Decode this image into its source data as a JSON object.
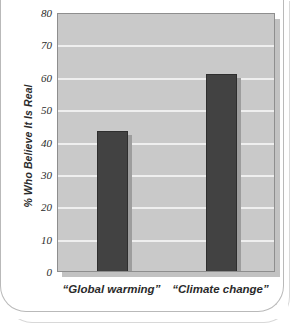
{
  "chart_data": {
    "type": "bar",
    "title": "",
    "subtitle": "",
    "xlabel": "",
    "ylabel": "% Who Believe It Is Real",
    "categories": [
      "“Global warming”",
      "“Climate change”"
    ],
    "values": [
      44,
      61.5
    ],
    "ylim": [
      0,
      80
    ],
    "yticks": [
      0,
      10,
      20,
      30,
      40,
      50,
      60,
      70,
      80
    ],
    "ytick_labels": [
      "0",
      "10",
      "20",
      "30",
      "40",
      "50",
      "60",
      "70",
      "80"
    ],
    "grid": true,
    "legend": false,
    "legend_position": "none",
    "colors": {
      "bar": "#424242",
      "bar_border": "#2e2e2e",
      "plot_background": "#c9c9c9",
      "gridline": "#efefef",
      "plot_border": "#8e8e8e",
      "text": "#2b2b2b",
      "page_background": "#ffffff"
    }
  }
}
